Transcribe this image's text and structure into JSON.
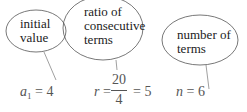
{
  "annotations": [
    {
      "label_line1": "initial",
      "label_line2": "value",
      "label_line3": ""
    },
    {
      "label_line1": "ratio of",
      "label_line2": "consecutive",
      "label_line3": "terms"
    },
    {
      "label_line1": "number of",
      "label_line2": "terms",
      "label_line3": ""
    }
  ],
  "formulas": {
    "a1": {
      "var": "a",
      "sub": "1",
      "eq": "=",
      "value": "4"
    },
    "r": {
      "var": "r",
      "eq": "=",
      "numerator": "20",
      "denominator": "4",
      "eq2": "=",
      "value": "5"
    },
    "n": {
      "var": "n",
      "eq": "=",
      "value": "6"
    }
  },
  "colors": {
    "stroke": "#555555",
    "text": "#222222",
    "formula": "#555555"
  }
}
